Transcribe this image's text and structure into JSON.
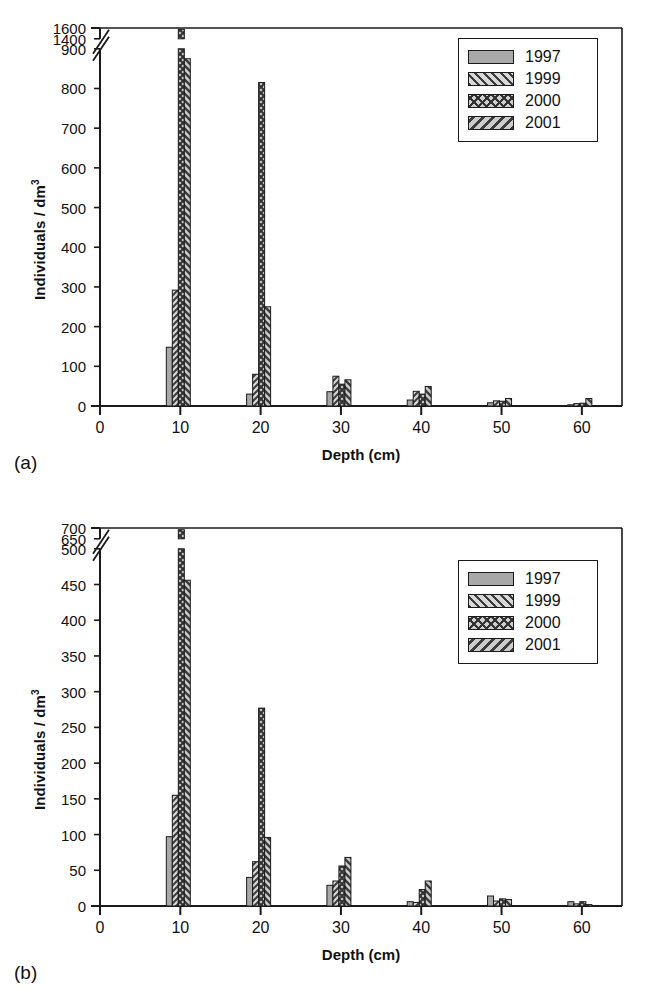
{
  "figure": {
    "panels": [
      {
        "tag": "(a)",
        "ylabel_text": "Individuals / dm",
        "ylabel_sup": "3",
        "xlabel": "Depth (cm)"
      },
      {
        "tag": "(b)",
        "ylabel_text": "Individuals / dm",
        "ylabel_sup": "3",
        "xlabel": "Depth (cm)"
      }
    ]
  },
  "legend": {
    "position": "top-right",
    "entries": [
      {
        "label": "1997",
        "pattern": "solid-gray",
        "swatch_class": "sw-solid"
      },
      {
        "label": "1999",
        "pattern": "forward-diagonal",
        "swatch_class": "sw-fwd"
      },
      {
        "label": "2000",
        "pattern": "crosshatch",
        "swatch_class": "sw-cross"
      },
      {
        "label": "2001",
        "pattern": "backward-diagonal",
        "swatch_class": "sw-back"
      }
    ]
  },
  "colors": {
    "axis": "#1a1a1a",
    "bar_outline": "#1a1a1a",
    "fill_1997": "#a8a8a8",
    "fill_1999": "#d8d8d8",
    "fill_2000": "#cfcfcf",
    "fill_2001": "#cccccc",
    "hatch": "#3c3c3c",
    "background": "#ffffff"
  },
  "chart_data": [
    {
      "type": "bar",
      "panel": "(a)",
      "title": "",
      "xlabel": "Depth (cm)",
      "ylabel": "Individuals / dm3",
      "xlim": [
        0,
        65
      ],
      "xticks": [
        0,
        10,
        20,
        30,
        40,
        50,
        60
      ],
      "xtick_labels": [
        "0",
        "10",
        "20",
        "30",
        "40",
        "50",
        "60"
      ],
      "yticks": [
        0,
        100,
        200,
        300,
        400,
        500,
        600,
        700,
        800,
        900,
        1400,
        1600
      ],
      "ytick_labels": [
        "0",
        "100",
        "200",
        "300",
        "400",
        "500",
        "600",
        "700",
        "800",
        "900",
        "1400",
        "1600"
      ],
      "axis_break": {
        "below": 900,
        "above": 1400
      },
      "grid": false,
      "legend_position": "upper right",
      "categories": [
        10,
        20,
        30,
        40,
        50,
        60
      ],
      "series": [
        {
          "name": "1997",
          "values": [
            148,
            30,
            36,
            15,
            8,
            3
          ]
        },
        {
          "name": "1999",
          "values": [
            292,
            80,
            75,
            37,
            13,
            6
          ]
        },
        {
          "name": "2000",
          "values": [
            1575,
            815,
            55,
            30,
            12,
            7
          ]
        },
        {
          "name": "2001",
          "values": [
            875,
            250,
            66,
            49,
            19,
            19
          ]
        }
      ]
    },
    {
      "type": "bar",
      "panel": "(b)",
      "title": "",
      "xlabel": "Depth (cm)",
      "ylabel": "Individuals / dm3",
      "xlim": [
        0,
        65
      ],
      "xticks": [
        0,
        10,
        20,
        30,
        40,
        50,
        60
      ],
      "xtick_labels": [
        "0",
        "10",
        "20",
        "30",
        "40",
        "50",
        "60"
      ],
      "yticks": [
        0,
        50,
        100,
        150,
        200,
        250,
        300,
        350,
        400,
        450,
        500,
        650,
        700
      ],
      "ytick_labels": [
        "0",
        "50",
        "100",
        "150",
        "200",
        "250",
        "300",
        "350",
        "400",
        "450",
        "500",
        "650",
        "700"
      ],
      "axis_break": {
        "below": 500,
        "above": 650
      },
      "grid": false,
      "legend_position": "upper right",
      "categories": [
        10,
        20,
        30,
        40,
        50,
        60
      ],
      "series": [
        {
          "name": "1997",
          "values": [
            97,
            40,
            29,
            6,
            14,
            6
          ]
        },
        {
          "name": "1999",
          "values": [
            155,
            62,
            35,
            5,
            7,
            3
          ]
        },
        {
          "name": "2000",
          "values": [
            692,
            277,
            56,
            23,
            10,
            6
          ]
        },
        {
          "name": "2001",
          "values": [
            456,
            96,
            68,
            35,
            9,
            2
          ]
        }
      ]
    }
  ]
}
